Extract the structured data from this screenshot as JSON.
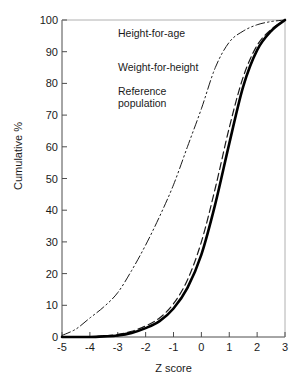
{
  "chart_data": {
    "type": "line",
    "title": "",
    "xlabel": "Z score",
    "ylabel": "Cumulative %",
    "xlim": [
      -5,
      3
    ],
    "ylim": [
      0,
      100
    ],
    "xticks": [
      "-5",
      "-4",
      "-3",
      "-2",
      "-1",
      "0",
      "1",
      "2",
      "3"
    ],
    "yticks": [
      "0",
      "10",
      "20",
      "30",
      "40",
      "50",
      "60",
      "70",
      "80",
      "90",
      "100"
    ],
    "grid": false,
    "legend_position": "top-left",
    "x": [
      -5,
      -4.5,
      -4,
      -3.5,
      -3,
      -2.5,
      -2,
      -1.5,
      -1,
      -0.5,
      0,
      0.5,
      1,
      1.5,
      2,
      2.5,
      3
    ],
    "series": [
      {
        "name": "Height-for-age",
        "style": "dash-dot",
        "color": "#1a1a1a",
        "width": 1,
        "values": [
          0.5,
          2.5,
          6,
          9.5,
          14,
          21,
          29,
          38,
          48,
          60,
          72,
          85,
          93,
          96.5,
          98.5,
          99.5,
          100
        ]
      },
      {
        "name": "Weight-for-height",
        "style": "dashed",
        "color": "#1a1a1a",
        "width": 1.2,
        "values": [
          0,
          0,
          0,
          0.3,
          0.8,
          1.8,
          3.5,
          6,
          10.5,
          18,
          30,
          47,
          66,
          82,
          92,
          97,
          100
        ]
      },
      {
        "name": "Reference population",
        "style": "solid",
        "color": "#000000",
        "width": 2.6,
        "values": [
          0,
          0,
          0,
          0.2,
          0.5,
          1.3,
          2.8,
          5,
          9,
          15.5,
          26,
          42,
          61,
          79,
          90.5,
          96.5,
          100
        ]
      }
    ]
  },
  "legend": {
    "items": [
      {
        "label": "Height-for-age",
        "label2": ""
      },
      {
        "label": "Weight-for-height",
        "label2": ""
      },
      {
        "label": "Reference",
        "label2": "population"
      }
    ]
  }
}
